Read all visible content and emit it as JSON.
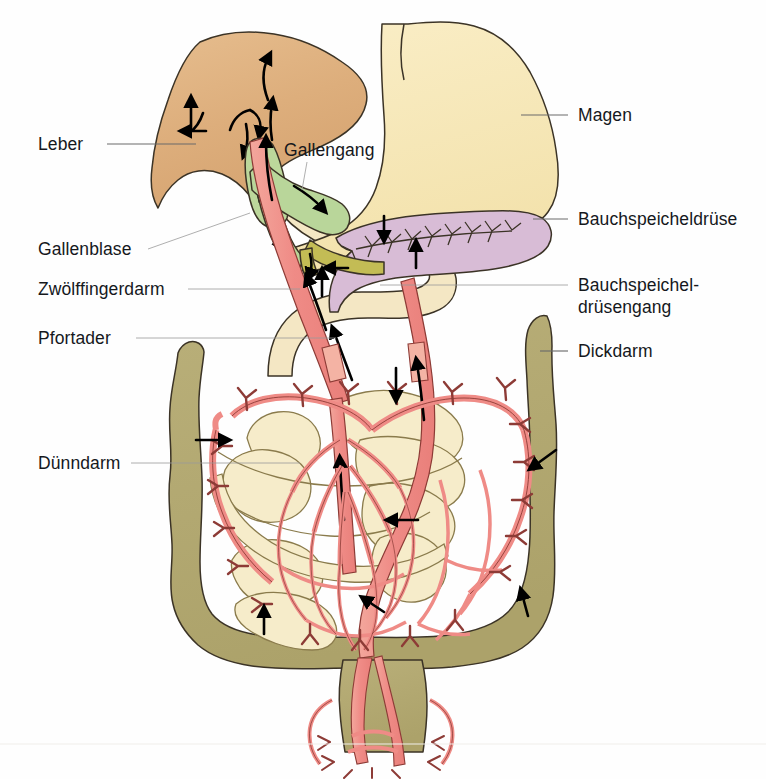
{
  "figure": {
    "language": "de",
    "background_color": "#fefefe"
  },
  "labels": {
    "leber": "Leber",
    "gallenblase": "Gallenblase",
    "zwoelffingerdarm": "Zwölffingerdarm",
    "pfortader": "Pfortader",
    "duenndarm": "Dünndarm",
    "gallengang": "Gallengang",
    "magen": "Magen",
    "bauchspeicheldruese": "Bauchspeicheldrüse",
    "bauchspeicheldruesengang_line1": "Bauchspeichel-",
    "bauchspeicheldruesengang_line2": "drüsengang",
    "dickdarm": "Dickdarm"
  },
  "colors": {
    "liver": "#e0b280",
    "liver_edge": "#b3824f",
    "stomach": "#f7e6b4",
    "stomach_edge": "#3b3326",
    "gallbladder": "#bcd79b",
    "gallbladder_edge": "#5c7a3c",
    "bile_duct": "#b9d69a",
    "pancreas": "#d8bcd6",
    "pancreas_edge": "#7a5878",
    "pancreatic_duct": "#c3bc55",
    "duodenum": "#f4e7c4",
    "small_intestine": "#f5ebcb",
    "large_intestine": "#b3a971",
    "large_intestine_edge": "#5d5630",
    "portal_vein": "#ef8b86",
    "portal_vein_light": "#f4b3a4",
    "vessel_edge": "#8d3b36",
    "label_text": "#15181c",
    "leader_line": "#6b6b6b"
  },
  "organ_names": {
    "liver": "liver-shape",
    "stomach": "stomach-shape",
    "gallbladder": "gallbladder-shape",
    "bile_duct": "bile-duct-shape",
    "pancreas": "pancreas-shape",
    "pancreatic_duct": "pancreatic-duct-shape",
    "duodenum": "duodenum-shape",
    "small_intestine": "small-intestine-shape",
    "large_intestine": "large-intestine-shape",
    "portal_vein": "portal-vein-shape",
    "rectum": "rectum-shape"
  },
  "flow_arrows": {
    "count": 18,
    "meaning": "Fließrichtung (Blut- und Sekretfluss)"
  }
}
